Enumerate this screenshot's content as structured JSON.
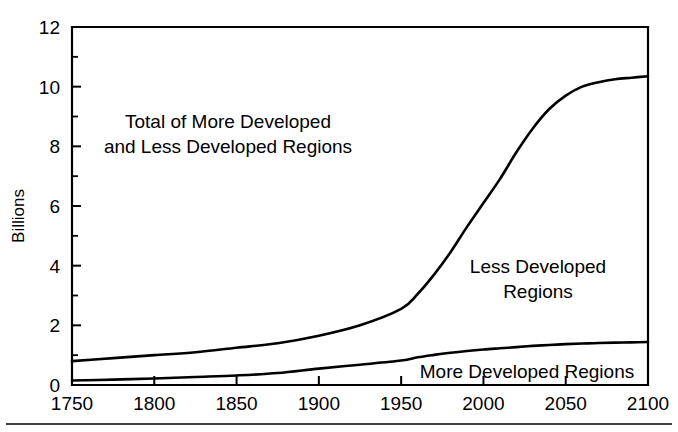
{
  "chart_data": {
    "type": "line",
    "title": "",
    "subtitle": "",
    "xlabel": "",
    "ylabel": "Billions",
    "xlim": [
      1750,
      2100
    ],
    "ylim": [
      0,
      12
    ],
    "grid": false,
    "legend_position": "inline-annotations",
    "x_ticks": [
      1750,
      1800,
      1850,
      1900,
      1950,
      2000,
      2050,
      2100
    ],
    "x_tick_labels": [
      "1750",
      "1800",
      "1850",
      "1900",
      "1950",
      "2000",
      "2050",
      "2100"
    ],
    "y_ticks": [
      0,
      2,
      4,
      6,
      8,
      10,
      12
    ],
    "y_tick_labels": [
      "0",
      "2",
      "4",
      "6",
      "8",
      "10",
      "12"
    ],
    "y_minor_ticks": [
      1,
      3,
      5,
      7,
      9,
      11
    ],
    "x": [
      1750,
      1775,
      1800,
      1825,
      1850,
      1875,
      1900,
      1925,
      1950,
      1960,
      1970,
      1980,
      1990,
      2000,
      2010,
      2020,
      2030,
      2040,
      2050,
      2060,
      2070,
      2080,
      2090,
      2100
    ],
    "series": [
      {
        "name": "Total of More Developed and Less Developed Regions",
        "values": [
          0.8,
          0.9,
          1.0,
          1.1,
          1.25,
          1.4,
          1.65,
          2.0,
          2.55,
          3.05,
          3.7,
          4.45,
          5.3,
          6.1,
          6.9,
          7.8,
          8.6,
          9.25,
          9.7,
          10.0,
          10.15,
          10.25,
          10.3,
          10.35
        ]
      },
      {
        "name": "More Developed Regions",
        "values": [
          0.15,
          0.18,
          0.22,
          0.27,
          0.32,
          0.4,
          0.55,
          0.68,
          0.82,
          0.93,
          1.01,
          1.08,
          1.14,
          1.19,
          1.23,
          1.27,
          1.31,
          1.34,
          1.37,
          1.39,
          1.41,
          1.42,
          1.43,
          1.44
        ]
      }
    ],
    "annotations": [
      {
        "name": "total-label",
        "lines": [
          "Total of More Developed",
          "and Less Developed Regions"
        ],
        "x": 228,
        "y": 128
      },
      {
        "name": "less-developed-label",
        "lines": [
          "Less Developed",
          "Regions"
        ],
        "x": 538,
        "y": 273
      },
      {
        "name": "more-developed-label",
        "lines": [
          "More Developed Regions"
        ],
        "x": 527,
        "y": 378
      }
    ],
    "colors": {
      "line": "#000000",
      "axis": "#000000",
      "background": "#ffffff"
    }
  }
}
